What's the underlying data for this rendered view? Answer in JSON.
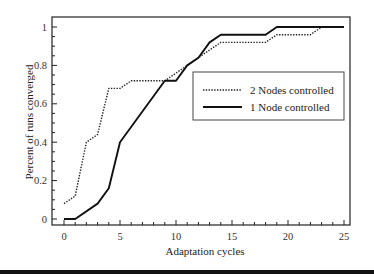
{
  "chart_data": {
    "type": "line",
    "title": "",
    "xlabel": "Adaptation cycles",
    "ylabel": "Percent of runs converged",
    "xlim": [
      -1,
      26
    ],
    "ylim": [
      -0.03,
      1.05
    ],
    "xticks": [
      0,
      5,
      10,
      15,
      20,
      25
    ],
    "xtick_labels": [
      "0",
      "5",
      "10",
      "15",
      "20",
      "25"
    ],
    "yticks": [
      0,
      0.2,
      0.4,
      0.6,
      0.8,
      1
    ],
    "ytick_labels": [
      "0",
      "0.2",
      "0.4",
      "0.6",
      "0.8",
      "1"
    ],
    "grid": false,
    "legend_position": "center-right",
    "series": [
      {
        "name": "2 Nodes controlled",
        "style": "dotted",
        "color": "#222222",
        "x": [
          0,
          1,
          2,
          3,
          4,
          5,
          6,
          9,
          10,
          11,
          12,
          13,
          14,
          18,
          19,
          22,
          23,
          25
        ],
        "y": [
          0.08,
          0.12,
          0.4,
          0.44,
          0.68,
          0.68,
          0.72,
          0.72,
          0.76,
          0.8,
          0.84,
          0.88,
          0.92,
          0.92,
          0.96,
          0.96,
          1.0,
          1.0
        ]
      },
      {
        "name": "1 Node controlled",
        "style": "solid",
        "color": "#111111",
        "x": [
          0,
          1,
          3,
          4,
          5,
          9,
          10,
          11,
          12,
          13,
          14,
          18,
          19,
          25
        ],
        "y": [
          0,
          0,
          0.08,
          0.16,
          0.4,
          0.72,
          0.72,
          0.8,
          0.84,
          0.92,
          0.96,
          0.96,
          1.0,
          1.0
        ]
      }
    ]
  },
  "legend": {
    "items": [
      {
        "label": "2 Nodes controlled",
        "style": "dotted"
      },
      {
        "label": "1 Node controlled",
        "style": "solid"
      }
    ]
  }
}
